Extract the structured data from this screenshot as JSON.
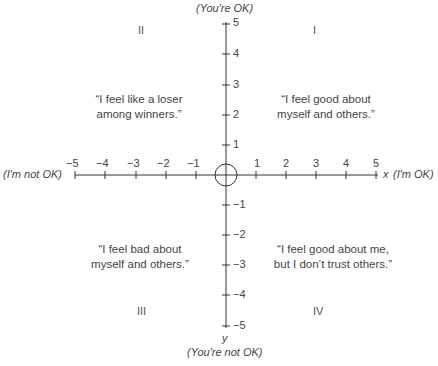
{
  "axes": {
    "x": {
      "name": "x",
      "positive_label": "(I'm OK)",
      "negative_label": "(I'm not OK)",
      "ticks": [
        "−5",
        "−4",
        "−3",
        "−2",
        "−1",
        "1",
        "2",
        "3",
        "4",
        "5"
      ],
      "range": [
        -5,
        5
      ]
    },
    "y": {
      "name": "y",
      "positive_label": "(You're OK)",
      "negative_label": "(You're not OK)",
      "ticks_pos": [
        "5",
        "4",
        "3",
        "2",
        "1"
      ],
      "ticks_neg": [
        "−1",
        "−2",
        "−3",
        "−4",
        "−5"
      ],
      "range": [
        -5,
        5
      ]
    }
  },
  "quadrants": {
    "I": {
      "numeral": "I",
      "quote_line1": "“I feel good about",
      "quote_line2": "myself and others.”"
    },
    "II": {
      "numeral": "II",
      "quote_line1": "“I feel like a loser",
      "quote_line2": "among winners.”"
    },
    "III": {
      "numeral": "III",
      "quote_line1": "“I feel bad about",
      "quote_line2": "myself and others.”"
    },
    "IV": {
      "numeral": "IV",
      "quote_line1": "“I feel good about me,",
      "quote_line2": "but I don’t trust others.”"
    }
  },
  "origin_marker": "circle-icon",
  "colors": {
    "axis": "#333333",
    "text": "#444444"
  }
}
